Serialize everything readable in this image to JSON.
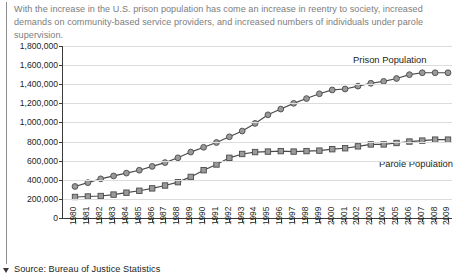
{
  "caption": "With the increase in the U.S. prison population has come an increase in reentry to society, increased demands on community-based service providers, and increased numbers of individuals under parole supervision.",
  "footer": {
    "source": "Source: Bureau of Justice Statistics"
  },
  "colors": {
    "marker_fill": "#9a9a9a",
    "marker_stroke": "#4a4a4a",
    "line": "#4a4a4a",
    "gridline": "#dcdcdc",
    "axis": "#3b3b3b",
    "caption_text": "#7d7d7d",
    "body_text": "#231f20"
  },
  "chart_data": {
    "type": "line",
    "title": "",
    "subtitle": "",
    "xlabel": "",
    "ylabel": "",
    "grid": true,
    "legend_position": "inline-annotation",
    "ylim": [
      0,
      1800000
    ],
    "ytick_step": 200000,
    "ytick_labels": [
      "1,800,000",
      "1,600,000",
      "1,400,000",
      "1,200,000",
      "1,000,000",
      "800,000",
      "600,000",
      "400,000",
      "200,000",
      "0"
    ],
    "ytick_values": [
      1800000,
      1600000,
      1400000,
      1200000,
      1000000,
      800000,
      600000,
      400000,
      200000,
      0
    ],
    "categories": [
      "1980",
      "1981",
      "1982",
      "1983",
      "1984",
      "1985",
      "1986",
      "1987",
      "1988",
      "1989",
      "1990",
      "1991",
      "1992",
      "1993",
      "1994",
      "1995",
      "1996",
      "1997",
      "1998",
      "1999",
      "2000",
      "2001",
      "2002",
      "2003",
      "2004",
      "2005",
      "2006",
      "2007",
      "2008",
      "2009"
    ],
    "series": [
      {
        "name": "Prison Population",
        "marker": "circle",
        "label_text": "Prison Population",
        "values": [
          330000,
          370000,
          410000,
          440000,
          470000,
          500000,
          540000,
          580000,
          630000,
          690000,
          740000,
          790000,
          850000,
          910000,
          990000,
          1080000,
          1140000,
          1200000,
          1250000,
          1300000,
          1340000,
          1350000,
          1380000,
          1410000,
          1430000,
          1460000,
          1500000,
          1520000,
          1520000,
          1520000
        ]
      },
      {
        "name": "Parole Population",
        "marker": "square",
        "label_text": "Parole Population",
        "values": [
          220000,
          225000,
          230000,
          245000,
          265000,
          285000,
          310000,
          340000,
          375000,
          430000,
          500000,
          560000,
          630000,
          670000,
          690000,
          695000,
          700000,
          695000,
          700000,
          705000,
          720000,
          730000,
          750000,
          770000,
          770000,
          785000,
          800000,
          810000,
          820000,
          820000
        ]
      }
    ]
  }
}
